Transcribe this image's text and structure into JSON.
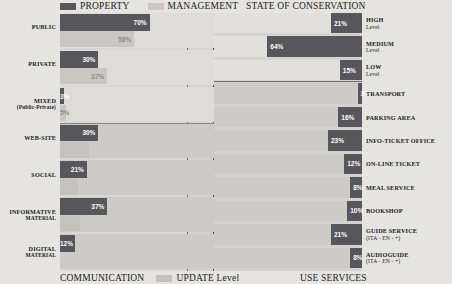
{
  "legend": {
    "property_label": "PROPERTY",
    "management_label": "MANAGEMENT",
    "update_label": "UPDATE Level",
    "property_color": "#57565a",
    "management_color": "#c9c7c3",
    "update_color": "#c4c2be"
  },
  "titles": {
    "top_right": "STATE OF CONSERVATION",
    "bottom_left": "COMMUNICATION",
    "bottom_right": "USE SERVICES"
  },
  "chart_data": {
    "type": "bar",
    "title": "",
    "subtitle": "",
    "xlabel": "",
    "ylabel": "",
    "grid": false,
    "legend_position": "top-left / bottom-left",
    "xlim": [
      0,
      100
    ],
    "panels": [
      {
        "name": "left-panel",
        "section_titles": [
          "",
          "COMMUNICATION"
        ],
        "series": [
          {
            "name": "PROPERTY",
            "color": "#57565a"
          },
          {
            "name": "MANAGEMENT",
            "color": "#c9c7c3"
          },
          {
            "name": "UPDATE Level",
            "color": "#c4c2be"
          }
        ],
        "categories": [
          "PUBLIC",
          "PRIVATE",
          "MIXED (Public-Private)",
          "WEB-SITE",
          "SOCIAL",
          "INFORMATIVE MATERIAL",
          "DIGITAL MATERIAL"
        ],
        "rows": [
          {
            "label": "PUBLIC",
            "label_sub": "",
            "primary": 70,
            "primary_text": "70%",
            "secondary": 58,
            "secondary_text": "58%",
            "group": "ownership"
          },
          {
            "label": "PRIVATE",
            "label_sub": "",
            "primary": 30,
            "primary_text": "30%",
            "secondary": 37,
            "secondary_text": "37%",
            "group": "ownership"
          },
          {
            "label": "MIXED",
            "label_sub": "(Public-Private)",
            "primary": 3,
            "primary_text": "3%",
            "secondary": 5,
            "secondary_text": "5%",
            "group": "ownership"
          },
          {
            "label": "WEB-SITE",
            "label_sub": "",
            "primary": 30,
            "primary_text": "30%",
            "secondary": 23,
            "secondary_text": "",
            "group": "communication"
          },
          {
            "label": "SOCIAL",
            "label_sub": "",
            "primary": 21,
            "primary_text": "21%",
            "secondary": 14,
            "secondary_text": "",
            "group": "communication"
          },
          {
            "label": "INFORMATIVE",
            "label_sub": "MATERIAL",
            "primary": 37,
            "primary_text": "37%",
            "secondary": 16,
            "secondary_text": "",
            "group": "communication"
          },
          {
            "label": "DIGITAL",
            "label_sub": "MATERIAL",
            "primary": 12,
            "primary_text": "12%",
            "secondary": 0,
            "secondary_text": "",
            "group": "communication"
          }
        ]
      },
      {
        "name": "right-panel",
        "section_titles": [
          "STATE OF CONSERVATION",
          "USE SERVICES"
        ],
        "series": [
          {
            "name": "Level / Service share",
            "color": "#57565a"
          }
        ],
        "categories": [
          "HIGH Level",
          "MEDIUM Level",
          "LOW Level",
          "TRANSPORT",
          "PARKING AREA",
          "INFO-TICKET OFFICE",
          "ON-LINE TICKET",
          "MEAL SERVICE",
          "BOOKSHOP",
          "GUIDE SERVICE (ITA - EN - +)",
          "AUDIOGUIDE (ITA - EN - +)"
        ],
        "rows": [
          {
            "label": "HIGH",
            "label_sub": "Level",
            "value": 21,
            "value_text": "21%",
            "group": "conservation"
          },
          {
            "label": "MEDIUM",
            "label_sub": "Level",
            "value": 64,
            "value_text": "64%",
            "group": "conservation"
          },
          {
            "label": "LOW",
            "label_sub": "Level",
            "value": 15,
            "value_text": "15%",
            "group": "conservation"
          },
          {
            "label": "TRANSPORT",
            "label_sub": "",
            "value": 3,
            "value_text": "3%",
            "group": "services"
          },
          {
            "label": "PARKING AREA",
            "label_sub": "",
            "value": 16,
            "value_text": "16%",
            "group": "services"
          },
          {
            "label": "INFO-TICKET OFFICE",
            "label_sub": "",
            "value": 23,
            "value_text": "23%",
            "group": "services"
          },
          {
            "label": "ON-LINE TICKET",
            "label_sub": "",
            "value": 12,
            "value_text": "12%",
            "group": "services"
          },
          {
            "label": "MEAL SERVICE",
            "label_sub": "",
            "value": 8,
            "value_text": "8%",
            "group": "services"
          },
          {
            "label": "BOOKSHOP",
            "label_sub": "",
            "value": 10,
            "value_text": "10%",
            "group": "services"
          },
          {
            "label": "GUIDE SERVICE",
            "label_sub": "(ITA - EN - +)",
            "value": 21,
            "value_text": "21%",
            "group": "services"
          },
          {
            "label": "AUDIOGUIDE",
            "label_sub": "(ITA - EN - +)",
            "value": 8,
            "value_text": "8%",
            "group": "services"
          }
        ]
      }
    ]
  }
}
